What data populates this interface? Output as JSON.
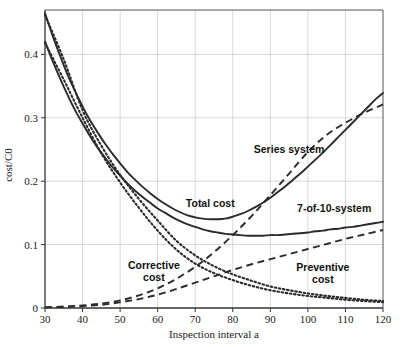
{
  "chart_data": {
    "type": "line",
    "title": "",
    "xlabel": "Inspection interval a",
    "ylabel": "cost/C0",
    "xlim": [
      30,
      120
    ],
    "ylim": [
      0,
      0.47
    ],
    "xticks": [
      30,
      40,
      50,
      60,
      70,
      80,
      90,
      100,
      110,
      120
    ],
    "xtick_labels": [
      "30",
      "40",
      "50",
      "60",
      "70",
      "80",
      "90",
      "100",
      "110",
      "120"
    ],
    "yticks": [
      0,
      0.1,
      0.2,
      0.3,
      0.4
    ],
    "ytick_labels": [
      "0",
      "0.1",
      "0.2",
      "0.3",
      "0.4"
    ],
    "grid": true,
    "legend_position": "inline-annotations",
    "annotations": [
      {
        "id": "series-system",
        "text": "Series system",
        "x": 95,
        "y": 0.245
      },
      {
        "id": "total-cost",
        "text": "Total cost",
        "x": 74,
        "y": 0.16
      },
      {
        "id": "seven-of-ten-system",
        "text": "7-of-10-system",
        "x": 107,
        "y": 0.152
      },
      {
        "id": "corrective-cost",
        "line1": "Corrective",
        "line2": "cost",
        "x": 59,
        "y": 0.062
      },
      {
        "id": "preventive-cost",
        "line1": "Preventive",
        "line2": "cost",
        "x": 104,
        "y": 0.058
      }
    ],
    "series": [
      {
        "name": "Total cost - Series system",
        "style": "solid",
        "x": [
          30,
          32,
          34,
          36,
          38,
          40,
          42,
          44,
          46,
          48,
          50,
          52,
          54,
          56,
          58,
          60,
          62,
          64,
          66,
          68,
          70,
          72,
          74,
          76,
          78,
          80,
          82,
          84,
          86,
          88,
          90,
          92,
          94,
          96,
          98,
          100,
          102,
          104,
          106,
          108,
          110,
          112,
          114,
          116,
          118,
          120
        ],
        "values": [
          0.465,
          0.43,
          0.398,
          0.368,
          0.342,
          0.318,
          0.296,
          0.277,
          0.259,
          0.243,
          0.228,
          0.214,
          0.202,
          0.191,
          0.181,
          0.172,
          0.164,
          0.157,
          0.151,
          0.146,
          0.143,
          0.141,
          0.14,
          0.14,
          0.141,
          0.144,
          0.148,
          0.153,
          0.159,
          0.166,
          0.174,
          0.183,
          0.192,
          0.202,
          0.212,
          0.223,
          0.234,
          0.245,
          0.257,
          0.269,
          0.281,
          0.293,
          0.305,
          0.317,
          0.329,
          0.339
        ]
      },
      {
        "name": "Total cost - 7-of-10-system",
        "style": "solid",
        "x": [
          30,
          32,
          34,
          36,
          38,
          40,
          42,
          44,
          46,
          48,
          50,
          52,
          54,
          56,
          58,
          60,
          62,
          64,
          66,
          68,
          70,
          72,
          74,
          76,
          78,
          80,
          82,
          84,
          86,
          88,
          90,
          92,
          94,
          96,
          98,
          100,
          102,
          104,
          106,
          108,
          110,
          112,
          114,
          116,
          118,
          120
        ],
        "values": [
          0.42,
          0.39,
          0.362,
          0.336,
          0.312,
          0.291,
          0.271,
          0.253,
          0.237,
          0.222,
          0.209,
          0.196,
          0.185,
          0.175,
          0.166,
          0.157,
          0.15,
          0.143,
          0.137,
          0.132,
          0.128,
          0.124,
          0.121,
          0.119,
          0.117,
          0.116,
          0.115,
          0.114,
          0.114,
          0.114,
          0.115,
          0.115,
          0.116,
          0.117,
          0.118,
          0.119,
          0.121,
          0.122,
          0.124,
          0.125,
          0.127,
          0.128,
          0.13,
          0.132,
          0.134,
          0.136
        ]
      },
      {
        "name": "Corrective cost - Series system",
        "style": "dashed",
        "x": [
          30,
          35,
          40,
          45,
          50,
          55,
          60,
          65,
          70,
          75,
          80,
          85,
          90,
          95,
          100,
          105,
          110,
          115,
          120
        ],
        "values": [
          0.001,
          0.002,
          0.004,
          0.007,
          0.012,
          0.02,
          0.031,
          0.046,
          0.065,
          0.088,
          0.115,
          0.145,
          0.178,
          0.212,
          0.246,
          0.273,
          0.292,
          0.308,
          0.321
        ]
      },
      {
        "name": "Corrective cost - 7-of-10-system",
        "style": "dashed",
        "x": [
          30,
          35,
          40,
          45,
          50,
          55,
          60,
          65,
          70,
          75,
          80,
          85,
          90,
          95,
          100,
          105,
          110,
          115,
          120
        ],
        "values": [
          0.001,
          0.002,
          0.003,
          0.005,
          0.009,
          0.014,
          0.021,
          0.03,
          0.04,
          0.05,
          0.06,
          0.069,
          0.077,
          0.085,
          0.093,
          0.101,
          0.109,
          0.116,
          0.123
        ]
      },
      {
        "name": "Preventive cost - upper",
        "style": "dotted",
        "x": [
          30,
          35,
          40,
          45,
          50,
          55,
          60,
          65,
          70,
          75,
          80,
          85,
          90,
          95,
          100,
          105,
          110,
          115,
          120
        ],
        "values": [
          0.462,
          0.392,
          0.312,
          0.256,
          0.21,
          0.172,
          0.138,
          0.106,
          0.083,
          0.066,
          0.053,
          0.043,
          0.034,
          0.028,
          0.023,
          0.019,
          0.016,
          0.013,
          0.011
        ]
      },
      {
        "name": "Preventive cost - lower",
        "style": "dotted",
        "x": [
          30,
          35,
          40,
          45,
          50,
          55,
          60,
          65,
          70,
          75,
          80,
          85,
          90,
          95,
          100,
          105,
          110,
          115,
          120
        ],
        "values": [
          0.418,
          0.36,
          0.3,
          0.244,
          0.198,
          0.158,
          0.122,
          0.092,
          0.07,
          0.055,
          0.044,
          0.035,
          0.028,
          0.023,
          0.019,
          0.016,
          0.013,
          0.011,
          0.009
        ]
      }
    ]
  },
  "figure": {
    "background": "#ffffff",
    "axis_color": "#555555",
    "grid_color": "#c8c8c8",
    "curve_color": "#2b2b2b"
  }
}
